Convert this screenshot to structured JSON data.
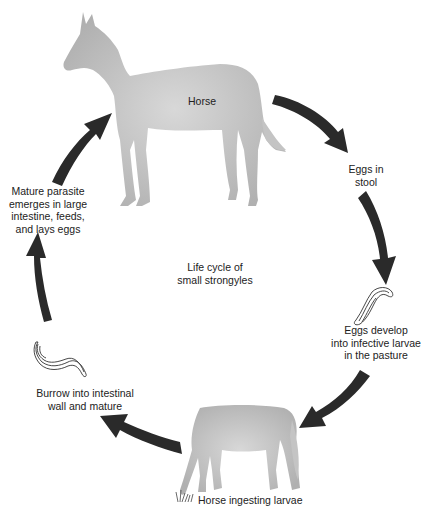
{
  "diagram": {
    "title": "Life cycle of small strongyles",
    "title_lines": [
      "Life cycle of",
      "small strongyles"
    ],
    "colors": {
      "arrow": "#2a2a2a",
      "horse_silhouette": "#b8b8b8",
      "background": "#ffffff",
      "text": "#222222"
    },
    "nodes": [
      {
        "id": "horse",
        "label": "Horse",
        "icon": "standing-horse-silhouette"
      },
      {
        "id": "eggs-in-stool",
        "lines": [
          "Eggs in",
          "stool"
        ]
      },
      {
        "id": "eggs-develop",
        "lines": [
          "Eggs develop",
          "into infective larvae",
          "in the pasture"
        ],
        "icon": "larva-icon"
      },
      {
        "id": "horse-ingesting",
        "label": "Horse ingesting larvae",
        "icon": "grazing-horse-silhouette"
      },
      {
        "id": "burrow",
        "lines": [
          "Burrow into intestinal",
          "wall and mature"
        ],
        "icon": "larva-icon"
      },
      {
        "id": "mature-parasite",
        "lines": [
          "Mature parasite",
          "emerges in large",
          "intestine, feeds,",
          "and lays eggs"
        ]
      }
    ],
    "edges": [
      {
        "from": "horse",
        "to": "eggs-in-stool"
      },
      {
        "from": "eggs-in-stool",
        "to": "eggs-develop"
      },
      {
        "from": "eggs-develop",
        "to": "horse-ingesting"
      },
      {
        "from": "horse-ingesting",
        "to": "burrow"
      },
      {
        "from": "burrow",
        "to": "mature-parasite"
      },
      {
        "from": "mature-parasite",
        "to": "horse"
      }
    ]
  }
}
